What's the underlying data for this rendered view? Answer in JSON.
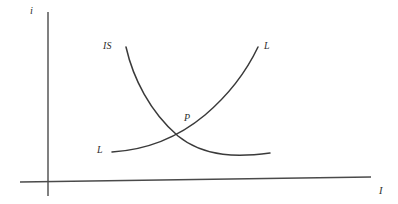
{
  "figure": {
    "type": "economics-line-diagram",
    "background_color": "#ffffff",
    "line_color": "#3a3a3a",
    "axis_color": "#4a4a4a"
  },
  "axes": {
    "y_axis_label": "i",
    "x_axis_label": "I",
    "y_axis_name": "interest-rate",
    "x_axis_name": "investment-income"
  },
  "curves": [
    {
      "id": "is-curve",
      "label": "IS",
      "shape": "downward-sloping-convex",
      "label_position": "upper-left"
    },
    {
      "id": "ll-curve",
      "label_right": "L",
      "label_left": "L",
      "shape": "upward-sloping-convex",
      "label_position": "upper-right-and-lower-left"
    }
  ],
  "points": [
    {
      "id": "equilibrium-point",
      "label": "P",
      "description": "intersection of IS and LL curves"
    }
  ],
  "chart_data": {
    "type": "line",
    "title": "",
    "xlabel": "I",
    "ylabel": "i",
    "grid": false,
    "legend": "inline-curve-labels",
    "annotations": [
      "IS",
      "L",
      "L",
      "P"
    ],
    "series": [
      {
        "name": "IS",
        "path": "M 126 47 C 133 78, 150 112, 178 136 C 205 158, 240 157, 270 153"
      },
      {
        "name": "LL",
        "path": "M 112 152 C 145 150, 175 140, 205 115 C 232 92, 248 68, 258 47"
      }
    ],
    "axis_paths": {
      "y_axis": "M 48 12 L 48 196",
      "x_axis": "M 20 182 L 371 177"
    }
  }
}
